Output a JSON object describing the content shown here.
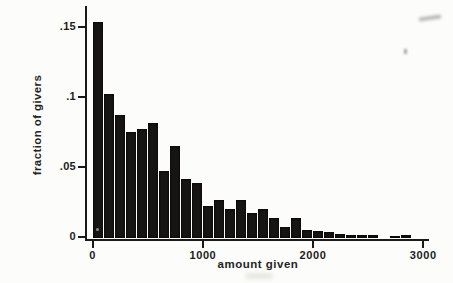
{
  "figure": {
    "background_color": "#fcfcfa",
    "bar_color": "#161514",
    "axis_color": "#1a1a1a",
    "text_color": "#1c1c1c"
  },
  "chart_data": {
    "type": "bar",
    "subtype": "histogram",
    "title": "",
    "xlabel": "amount given",
    "ylabel": "fraction of givers",
    "bin_width": 100,
    "bin_starts": [
      0,
      100,
      200,
      300,
      400,
      500,
      600,
      700,
      800,
      900,
      1000,
      1100,
      1200,
      1300,
      1400,
      1500,
      1600,
      1700,
      1800,
      1900,
      2000,
      2100,
      2200,
      2300,
      2400,
      2500,
      2600,
      2700,
      2800
    ],
    "values": [
      0.154,
      0.103,
      0.088,
      0.076,
      0.078,
      0.082,
      0.048,
      0.066,
      0.042,
      0.039,
      0.023,
      0.027,
      0.021,
      0.027,
      0.018,
      0.021,
      0.014,
      0.008,
      0.014,
      0.006,
      0.005,
      0.004,
      0.003,
      0.0025,
      0.0025,
      0.002,
      0,
      0.0013,
      0.0025
    ],
    "x_ticks": [
      {
        "label": "0",
        "value": 0
      },
      {
        "label": "1000",
        "value": 1000
      },
      {
        "label": "2000",
        "value": 2000
      },
      {
        "label": "3000",
        "value": 3000
      }
    ],
    "y_ticks": [
      {
        "label": ".15",
        "value": 0.15
      },
      {
        "label": ".1",
        "value": 0.1
      },
      {
        "label": ".05",
        "value": 0.05
      },
      {
        "label": "0",
        "value": 0
      }
    ],
    "xlim": [
      0,
      3000
    ],
    "ylim": [
      0,
      0.155
    ],
    "grid": false,
    "legend": false
  }
}
